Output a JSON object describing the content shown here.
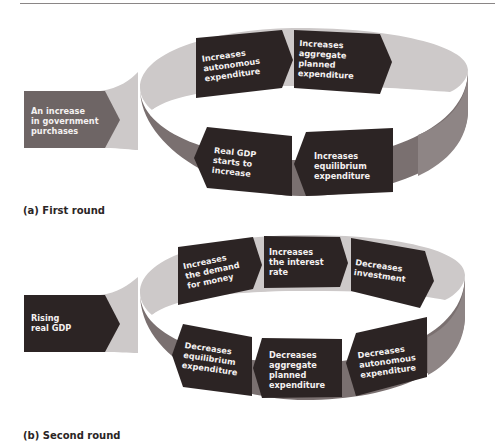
{
  "colors": {
    "inner_band": "#cdc9c9",
    "outer_wall": "#7a7070",
    "right_wall": "#8e8585",
    "box_dark": "#2c2424",
    "start_box_a": "#6e6565",
    "start_box_b": "#2c2424",
    "text": "#f4f1f1",
    "rule": "#8a8686"
  },
  "panel_a": {
    "caption": "(a) First round",
    "start": [
      "An increase",
      "in government",
      "purchases"
    ],
    "steps": [
      {
        "lines": [
          "Increases",
          "autonomous",
          "expenditure"
        ]
      },
      {
        "lines": [
          "Increases",
          "aggregate",
          "planned",
          "expenditure"
        ]
      },
      {
        "lines": [
          "Increases",
          "equilibrium",
          "expenditure"
        ]
      },
      {
        "lines": [
          "Real GDP",
          "starts to",
          "increase"
        ]
      }
    ]
  },
  "panel_b": {
    "caption": "(b) Second round",
    "start": [
      "Rising",
      "real GDP"
    ],
    "steps": [
      {
        "lines": [
          "Increases",
          "the demand",
          "for money"
        ]
      },
      {
        "lines": [
          "Increases",
          "the interest",
          "rate"
        ]
      },
      {
        "lines": [
          "Decreases",
          "investment"
        ]
      },
      {
        "lines": [
          "Decreases",
          "autonomous",
          "expenditure"
        ]
      },
      {
        "lines": [
          "Decreases",
          "aggregate",
          "planned",
          "expenditure"
        ]
      },
      {
        "lines": [
          "Decreases",
          "equilibrium",
          "expenditure"
        ]
      }
    ]
  }
}
